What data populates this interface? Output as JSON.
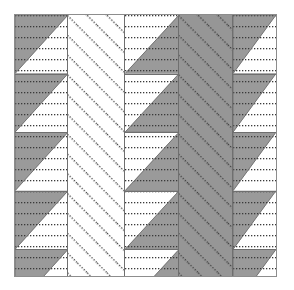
{
  "figure": {
    "title": "",
    "kind": "hatched-pattern-tiling",
    "frame": {
      "border_color": "#8d8d8d",
      "background": "#ffffff",
      "x": 14,
      "y": 14,
      "width": 263,
      "height": 263
    },
    "colors": {
      "gray_fill": "#9a9a9a",
      "gray_fill_dark": "#969696",
      "white_fill": "#ffffff",
      "hatch_dot": "#3a3a3a",
      "separator": "#6f6f6f",
      "frame_border": "#8d8d8d"
    },
    "row_height": 58.6,
    "row_count": 4.5,
    "columns": [
      {
        "index": 1,
        "name": "column-upper-left-triangles-a",
        "x": 0,
        "width": 53,
        "fill": "#9a9a9a",
        "hatch": "horizontal-dotted",
        "motif": "upper-left-triangle",
        "triangle_fill": "#9a9a9a",
        "triangle_remainder": "#ffffff"
      },
      {
        "index": 2,
        "name": "column-diagonal-hatch-white",
        "x": 53,
        "width": 57,
        "fill": "#ffffff",
        "hatch": "diagonal-dotted-backslash",
        "motif": "full-block"
      },
      {
        "index": 3,
        "name": "column-lower-right-triangles",
        "x": 110,
        "width": 54,
        "fill": "#9a9a9a",
        "hatch": "horizontal-dotted",
        "motif": "lower-right-triangle",
        "triangle_fill": "#9a9a9a",
        "triangle_remainder": "#ffffff"
      },
      {
        "index": 4,
        "name": "column-diagonal-hatch-gray",
        "x": 164,
        "width": 54,
        "fill": "#969696",
        "hatch": "diagonal-dotted-backslash",
        "motif": "full-block"
      },
      {
        "index": 5,
        "name": "column-upper-left-triangles-b",
        "x": 218,
        "width": 43,
        "fill": "#9a9a9a",
        "hatch": "horizontal-dotted",
        "motif": "upper-left-triangle",
        "triangle_fill": "#9a9a9a",
        "triangle_remainder": "#ffffff"
      }
    ],
    "hatch_specs": {
      "horizontal_dotted": {
        "spacing": 11,
        "dot_size": 1,
        "dot_gap": 2,
        "color": "#3a3a3a"
      },
      "diagonal_dotted": {
        "spacing": 14,
        "angle_deg": -45,
        "dot_size": 1,
        "dot_gap": 2,
        "color": "#3a3a3a"
      }
    }
  }
}
